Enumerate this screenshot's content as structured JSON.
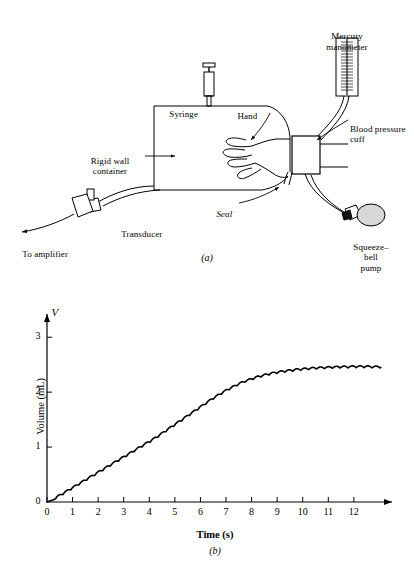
{
  "figure": {
    "panel_a": {
      "caption": "(a)",
      "labels": {
        "mercury_manometer": "Mercury\nmanometer",
        "syringe": "Syringe",
        "hand": "Hand",
        "blood_pressure_cuff": "Blood pressure\ncuff",
        "rigid_wall_container": "Rigid wall\ncontainer",
        "seal": "Seal",
        "transducer": "Transducer",
        "to_amplifier": "To amplifier",
        "squeeze_bell_pump": "Squeeze–bell\npump"
      },
      "colors": {
        "stroke": "#000000",
        "background": "#ffffff",
        "bulb_fill": "#d8d8d8",
        "manometer_fill": "#ffffff"
      }
    },
    "panel_b": {
      "caption": "(b)"
    }
  },
  "chart_data": {
    "type": "line",
    "title": "",
    "subtitle": "",
    "xlabel": "Time (s)",
    "ylabel": "Volume (mL)",
    "y_axis_symbol": "V",
    "xlim": [
      0,
      13.1
    ],
    "ylim": [
      0,
      3.35
    ],
    "grid": false,
    "legend": null,
    "xticks": [
      0,
      1,
      2,
      3,
      4,
      5,
      6,
      7,
      8,
      9,
      10,
      11,
      12
    ],
    "xtick_labels": [
      "0",
      "1",
      "2",
      "3",
      "4",
      "5",
      "6",
      "7",
      "8",
      "9",
      "10",
      "11",
      "12"
    ],
    "yticks": [
      0,
      1,
      2,
      3
    ],
    "ytick_labels": [
      "0",
      "1",
      "2",
      "3"
    ],
    "series": [
      {
        "name": "Volume",
        "description": "Plethysmographic volume rise with superimposed arterial pulsations",
        "pulsation_amplitude_ml": 0.035,
        "pulsation_period_s": 0.31,
        "x": [
          0.0,
          0.25,
          0.5,
          0.75,
          1.0,
          1.25,
          1.5,
          1.75,
          2.0,
          2.25,
          2.5,
          2.75,
          3.0,
          3.25,
          3.5,
          3.75,
          4.0,
          4.25,
          4.5,
          4.75,
          5.0,
          5.25,
          5.5,
          5.75,
          6.0,
          6.25,
          6.5,
          6.75,
          7.0,
          7.25,
          7.5,
          7.75,
          8.0,
          8.25,
          8.5,
          8.75,
          9.0,
          9.25,
          9.5,
          9.75,
          10.0,
          10.25,
          10.5,
          10.75,
          11.0,
          11.25,
          11.5,
          11.75,
          12.0,
          12.25,
          12.5,
          12.75,
          13.0
        ],
        "y": [
          0.0,
          0.04,
          0.1,
          0.17,
          0.24,
          0.31,
          0.38,
          0.45,
          0.52,
          0.59,
          0.66,
          0.73,
          0.8,
          0.87,
          0.94,
          1.01,
          1.08,
          1.15,
          1.23,
          1.31,
          1.39,
          1.47,
          1.55,
          1.63,
          1.71,
          1.79,
          1.87,
          1.94,
          2.01,
          2.07,
          2.13,
          2.18,
          2.22,
          2.26,
          2.29,
          2.32,
          2.34,
          2.36,
          2.375,
          2.39,
          2.4,
          2.41,
          2.42,
          2.425,
          2.43,
          2.435,
          2.44,
          2.44,
          2.445,
          2.445,
          2.445,
          2.44,
          2.44
        ]
      }
    ]
  }
}
